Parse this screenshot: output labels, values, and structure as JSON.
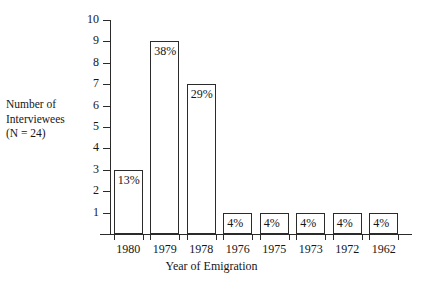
{
  "chart_data": {
    "type": "bar",
    "title": "",
    "subtitle": "",
    "categories": [
      "1980",
      "1979",
      "1978",
      "1976",
      "1975",
      "1973",
      "1972",
      "1962"
    ],
    "values": [
      3,
      9,
      7,
      1,
      1,
      1,
      1,
      1
    ],
    "data_labels": [
      "13%",
      "38%",
      "29%",
      "4%",
      "4%",
      "4%",
      "4%",
      "4%"
    ],
    "xlabel": "Year of Emigration",
    "ylabel_lines": [
      "Number of",
      "Interviewees",
      "(N = 24)"
    ],
    "ylabel": "Number of Interviewees (N = 24)",
    "ylim": [
      0,
      10
    ],
    "yticks": [
      10,
      9,
      8,
      7,
      6,
      5,
      4,
      3,
      2,
      1
    ],
    "ytick_labels": [
      "10",
      "9",
      "8",
      "7",
      "6",
      "5",
      "4",
      "3",
      "2",
      "1"
    ],
    "grid": false,
    "legend": false,
    "bar_fill": "#ffffff",
    "bar_edge": "#2b2b2b",
    "axis_color": "#2b2b2b",
    "text_color": "#161616"
  }
}
